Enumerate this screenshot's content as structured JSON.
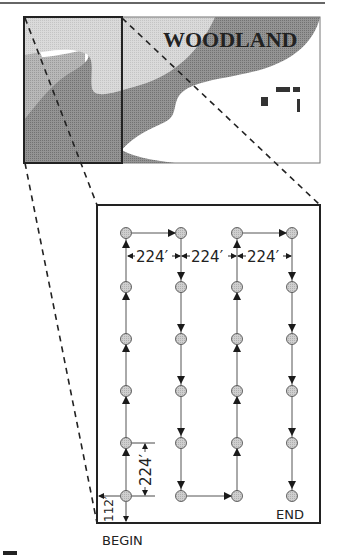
{
  "map": {
    "title": "WOODLAND",
    "colors": {
      "light_region": "#d6d6d6",
      "medium_region": "#b4b4b4",
      "dark_band": "#8c8c8c",
      "open_field": "#ffffff",
      "outline": "#2a2a2a"
    },
    "buildings_count": 4
  },
  "grid": {
    "columns": 4,
    "rows": 6,
    "point_color": "#c9c9c9",
    "spacing_label": "224′",
    "horizontal_spacing_labels": [
      "224′",
      "224′",
      "224′"
    ],
    "vertical_spacing_label": "224′",
    "edge_offset_label": "112′",
    "path_order": "serpentine: up column 1, down column 2, up column 3, down column 4"
  },
  "labels": {
    "begin": "BEGIN",
    "end": "END"
  }
}
